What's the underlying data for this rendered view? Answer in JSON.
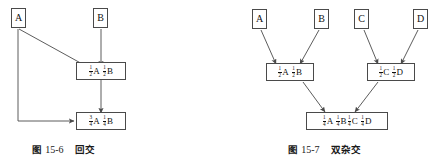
{
  "figures": [
    {
      "id": "fig-15-6",
      "caption_label": "图",
      "caption_number": "15-6",
      "caption_title": "回交",
      "nodes": {
        "parent_a": {
          "text": "A"
        },
        "parent_b": {
          "text": "B"
        },
        "f1": {
          "terms": [
            {
              "num": "1",
              "den": "2",
              "allele": "A"
            },
            {
              "num": "1",
              "den": "2",
              "allele": "B"
            }
          ],
          "plain": "1/2A 1/2B"
        },
        "bc1": {
          "terms": [
            {
              "num": "3",
              "den": "4",
              "allele": "A"
            },
            {
              "num": "1",
              "den": "4",
              "allele": "B"
            }
          ],
          "plain": "3/4A 1/4B"
        }
      }
    },
    {
      "id": "fig-15-7",
      "caption_label": "图",
      "caption_number": "15-7",
      "caption_title": "双杂交",
      "nodes": {
        "parent_a": {
          "text": "A"
        },
        "parent_b": {
          "text": "B"
        },
        "parent_c": {
          "text": "C"
        },
        "parent_d": {
          "text": "D"
        },
        "f1_ab": {
          "terms": [
            {
              "num": "1",
              "den": "2",
              "allele": "A"
            },
            {
              "num": "1",
              "den": "2",
              "allele": "B"
            }
          ],
          "plain": "1/2A 1/2B"
        },
        "f1_cd": {
          "terms": [
            {
              "num": "1",
              "den": "2",
              "allele": "C"
            },
            {
              "num": "1",
              "den": "2",
              "allele": "D"
            }
          ],
          "plain": "1/2C 1/2D"
        },
        "dc": {
          "terms": [
            {
              "num": "1",
              "den": "4",
              "allele": "A"
            },
            {
              "num": "1",
              "den": "4",
              "allele": "B"
            },
            {
              "num": "1",
              "den": "4",
              "allele": "C"
            },
            {
              "num": "1",
              "den": "4",
              "allele": "D"
            }
          ],
          "plain": "1/4A 1/4B 1/4C 1/4D"
        }
      }
    }
  ],
  "style": {
    "line_color": "#4a4a4a",
    "text_color": "#111111",
    "background": "#ffffff"
  }
}
